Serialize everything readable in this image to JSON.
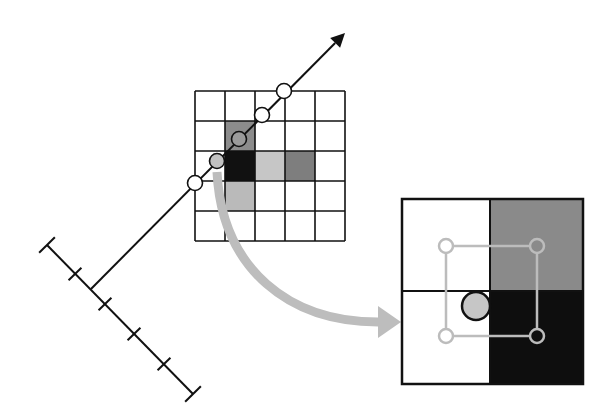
{
  "diagram": {
    "colors": {
      "background": "#ffffff",
      "line": "#111111",
      "arrow_gray": "#bdbdbd",
      "sample_gray": "#c2c2c2",
      "interp_stroke": "#bcbcbc"
    },
    "ruler": {
      "start": [
        47,
        245
      ],
      "end": [
        193,
        394
      ],
      "ticks": [
        [
          75,
          274
        ],
        [
          105,
          304
        ],
        [
          134,
          334
        ],
        [
          164,
          364
        ]
      ],
      "caps": [
        [
          47,
          245
        ],
        [
          193,
          394
        ]
      ]
    },
    "ray": {
      "origin": [
        91,
        289
      ],
      "tip": [
        345,
        33
      ]
    },
    "grid": {
      "x": 195,
      "y": 91,
      "cols": 5,
      "rows": 5,
      "cell": 30,
      "shaded_cells": [
        {
          "row": 1,
          "col": 1,
          "color": "#8c8c8c"
        },
        {
          "row": 2,
          "col": 1,
          "color": "#111111"
        },
        {
          "row": 2,
          "col": 2,
          "color": "#c6c6c6"
        },
        {
          "row": 2,
          "col": 3,
          "color": "#7e7e7e"
        },
        {
          "row": 3,
          "col": 1,
          "color": "#bababa"
        }
      ]
    },
    "samples": [
      {
        "cx": 195,
        "cy": 183,
        "fill": "#ffffff"
      },
      {
        "cx": 217,
        "cy": 161,
        "fill": "#c2c2c2"
      },
      {
        "cx": 239,
        "cy": 139,
        "fill": "#9a9a9a"
      },
      {
        "cx": 262,
        "cy": 115,
        "fill": "#ffffff"
      },
      {
        "cx": 284,
        "cy": 91,
        "fill": "#ffffff"
      }
    ],
    "curved_arrow": {
      "path": "M 217 172 C 222 270, 290 322, 378 322",
      "head": [
        [
          378,
          306
        ],
        [
          401,
          322
        ],
        [
          378,
          338
        ]
      ]
    },
    "magnified": {
      "x": 402,
      "y": 199,
      "w": 181,
      "h": 185,
      "split_x": 490,
      "split_y": 291,
      "quadrants": [
        {
          "name": "top-left",
          "color": "#ffffff"
        },
        {
          "name": "top-right",
          "color": "#8a8a8a"
        },
        {
          "name": "bottom-left",
          "color": "#ffffff"
        },
        {
          "name": "bottom-right",
          "color": "#0e0e0e"
        }
      ],
      "interp_points": [
        {
          "cx": 446,
          "cy": 246,
          "fill": "#ffffff"
        },
        {
          "cx": 537,
          "cy": 246,
          "fill": "#8a8a8a"
        },
        {
          "cx": 446,
          "cy": 336,
          "fill": "#ffffff"
        },
        {
          "cx": 537,
          "cy": 336,
          "fill": "#0e0e0e"
        }
      ],
      "sample": {
        "cx": 476,
        "cy": 306,
        "r": 14,
        "fill": "#c6c6c6"
      }
    }
  }
}
